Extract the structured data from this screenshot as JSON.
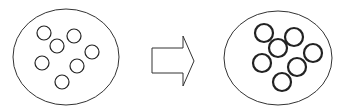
{
  "diagram": {
    "colors": {
      "stroke": "#222222",
      "background": "#ffffff"
    },
    "before": {
      "container": {
        "cx": 66,
        "cy": 57,
        "rx": 53,
        "ry": 48
      },
      "particle_radius": 7,
      "particle_stroke": 1.2,
      "particles": [
        {
          "cx": 44,
          "cy": 33
        },
        {
          "cx": 74,
          "cy": 36
        },
        {
          "cx": 57,
          "cy": 46
        },
        {
          "cx": 92,
          "cy": 52
        },
        {
          "cx": 42,
          "cy": 63
        },
        {
          "cx": 77,
          "cy": 66
        },
        {
          "cx": 62,
          "cy": 82
        }
      ]
    },
    "arrow": {
      "direction": "right",
      "label": ""
    },
    "after": {
      "container": {
        "cx": 278,
        "cy": 58,
        "rx": 54,
        "ry": 47
      },
      "particle_radius": 9,
      "particle_stroke": 2.2,
      "particles": [
        {
          "cx": 264,
          "cy": 33
        },
        {
          "cx": 294,
          "cy": 37
        },
        {
          "cx": 278,
          "cy": 48
        },
        {
          "cx": 313,
          "cy": 53
        },
        {
          "cx": 262,
          "cy": 63
        },
        {
          "cx": 297,
          "cy": 67
        },
        {
          "cx": 282,
          "cy": 82
        }
      ]
    }
  }
}
